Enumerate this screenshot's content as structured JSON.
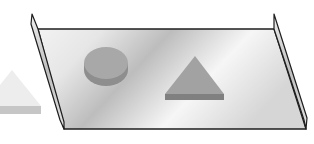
{
  "figure": {
    "colors": {
      "background": "#ffffff",
      "outline": "#1e1e1e",
      "plate_light": "#f4f4f4",
      "plate_dark": "#b9b9b9",
      "wall_face": "#d0d0d0",
      "disk_top": "#a7a7a7",
      "disk_side": "#8c8c8c",
      "prism_top": "#a0a0a0",
      "prism_side": "#7f7f7f",
      "outside_prism_top": "#ececec",
      "outside_prism_side": "#c4c4c4"
    },
    "objects": [
      {
        "name": "plate",
        "shape": "parallelogram"
      },
      {
        "name": "left-wall",
        "shape": "thin wall"
      },
      {
        "name": "right-wall",
        "shape": "thin wall"
      },
      {
        "name": "disk",
        "shape": "cylinder"
      },
      {
        "name": "triangle-prism-on-plate",
        "shape": "triangular prism"
      },
      {
        "name": "triangle-prism-outside",
        "shape": "triangular prism"
      }
    ]
  }
}
